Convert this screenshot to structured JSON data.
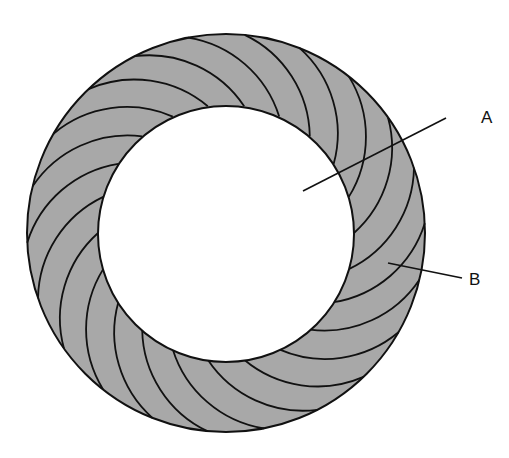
{
  "diagram": {
    "type": "turbine-ring",
    "colors": {
      "background": "#ffffff",
      "ring_fill": "#a8a8a8",
      "stroke": "#111111",
      "center_fill": "#ffffff"
    },
    "geometry": {
      "center": [
        226,
        233
      ],
      "outer_radius": 199,
      "inner_radius": 128,
      "blade_count": 22
    },
    "labels": [
      {
        "id": "A",
        "text": "A",
        "target": "hollow center",
        "text_pos": [
          487,
          123
        ],
        "line": [
          [
            303,
            191
          ],
          [
            446,
            118
          ]
        ]
      },
      {
        "id": "B",
        "text": "B",
        "text_pos": [
          475,
          285
        ],
        "target": "blade segment",
        "line": [
          [
            388,
            263
          ],
          [
            462,
            278
          ]
        ]
      }
    ]
  }
}
